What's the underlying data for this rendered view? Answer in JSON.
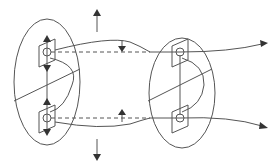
{
  "figure": {
    "type": "schematic",
    "colors": {
      "line": "#555555",
      "arrowhead": "#333333",
      "background": "#ffffff"
    },
    "elements": {
      "left_loop": {
        "shape": "ellipse",
        "center": [
          47,
          82
        ],
        "rx": 33,
        "ry": 63
      },
      "right_loop": {
        "shape": "ellipse",
        "center": [
          182,
          93
        ],
        "rx": 33,
        "ry": 55
      },
      "left_top_plate": {
        "center": [
          47,
          52
        ]
      },
      "left_bottom_plate": {
        "center": [
          47,
          118
        ]
      },
      "right_top_plate": {
        "center": [
          180,
          52
        ]
      },
      "right_bottom_plate": {
        "center": [
          180,
          118
        ]
      },
      "arrows": [
        {
          "name": "up-arrow",
          "from": [
            97,
            30
          ],
          "to": [
            97,
            10
          ]
        },
        {
          "name": "down-arrow",
          "from": [
            97,
            140
          ],
          "to": [
            97,
            160
          ]
        },
        {
          "name": "top-field-arrow",
          "direction": "down",
          "x": 122
        },
        {
          "name": "bottom-field-arrow",
          "direction": "up",
          "x": 122
        },
        {
          "name": "top-exit-arrow",
          "direction": "right",
          "to": [
            268,
            43
          ]
        },
        {
          "name": "bottom-exit-arrow",
          "direction": "right",
          "to": [
            268,
            128
          ]
        }
      ]
    }
  }
}
